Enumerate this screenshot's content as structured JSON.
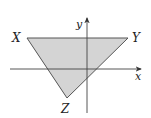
{
  "diagram": {
    "type": "coordinate-plane-triangle",
    "fill_color": "#d4d4d4",
    "stroke_color": "#555555",
    "axes": {
      "x_label": "x",
      "y_label": "y"
    },
    "vertices": [
      {
        "label": "X",
        "quadrant": "II"
      },
      {
        "label": "Y",
        "quadrant": "I"
      },
      {
        "label": "Z",
        "quadrant": "III"
      }
    ]
  }
}
